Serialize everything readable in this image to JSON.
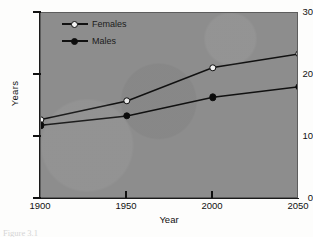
{
  "figure": {
    "caption": "Figure 3.1"
  },
  "chart_data": {
    "type": "line",
    "title": "",
    "subtitle": "",
    "xlabel": "Year",
    "ylabel": "Years",
    "x": [
      1900,
      1950,
      2000,
      2050
    ],
    "xtick_labels": [
      "1900",
      "1950",
      "2000",
      "2050"
    ],
    "ytick_labels": [
      "0",
      "10",
      "20",
      "30"
    ],
    "yticks": [
      0,
      10,
      20,
      30
    ],
    "xlim": [
      1900,
      2050
    ],
    "ylim": [
      0,
      30
    ],
    "grid": false,
    "legend_position": "inside top-left",
    "series": [
      {
        "name": "Females",
        "marker": "open-circle",
        "color": "#111111",
        "values": [
          12.8,
          15.8,
          21.2,
          23.4
        ]
      },
      {
        "name": "Males",
        "marker": "filled-circle",
        "color": "#111111",
        "values": [
          11.9,
          13.4,
          16.4,
          18.1
        ]
      }
    ]
  },
  "style": {
    "plot_background": "#8d8d8d",
    "page_background": "#fdfdfc",
    "ink": "#111111"
  }
}
